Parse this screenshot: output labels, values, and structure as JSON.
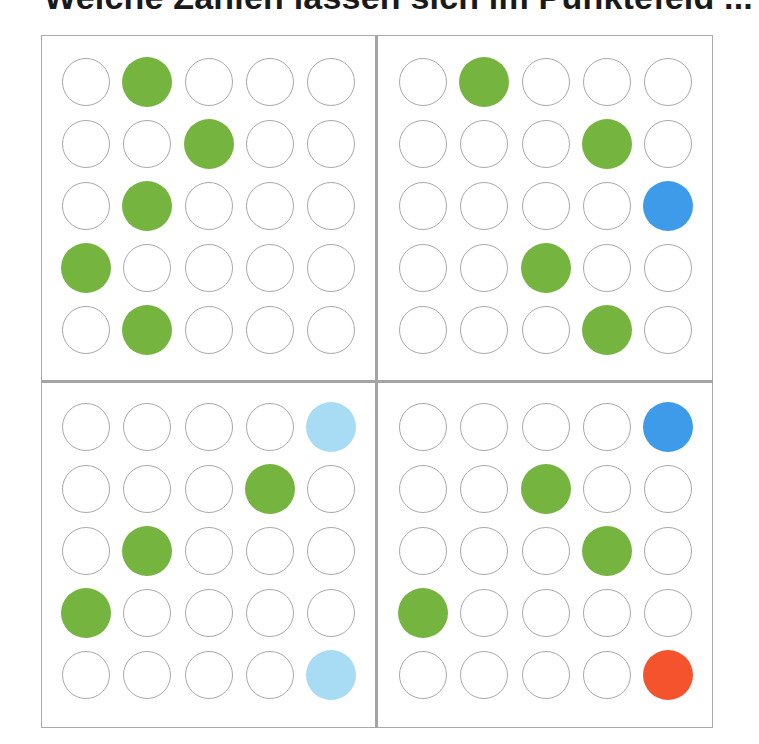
{
  "title": "Welche Zahlen lassen sich im Punktefeld ...",
  "colors": {
    "empty_outline": "#a9a9a9",
    "green": "#74b43f",
    "blue": "#3d9bea",
    "light_blue": "#a8dcf5",
    "red": "#f4532e",
    "divider": "#a4a4a4"
  },
  "grid": {
    "rows": 5,
    "cols": 5
  },
  "panels": [
    {
      "name": "top-left",
      "origin": [
        86,
        82
      ],
      "filled": [
        {
          "row": 0,
          "col": 1,
          "color": "green"
        },
        {
          "row": 1,
          "col": 2,
          "color": "green"
        },
        {
          "row": 2,
          "col": 1,
          "color": "green"
        },
        {
          "row": 3,
          "col": 0,
          "color": "green"
        },
        {
          "row": 4,
          "col": 1,
          "color": "green"
        }
      ]
    },
    {
      "name": "top-right",
      "origin": [
        423,
        82
      ],
      "filled": [
        {
          "row": 0,
          "col": 1,
          "color": "green"
        },
        {
          "row": 1,
          "col": 3,
          "color": "green"
        },
        {
          "row": 2,
          "col": 4,
          "color": "blue"
        },
        {
          "row": 3,
          "col": 2,
          "color": "green"
        },
        {
          "row": 4,
          "col": 3,
          "color": "green"
        }
      ]
    },
    {
      "name": "bottom-left",
      "origin": [
        86,
        427
      ],
      "filled": [
        {
          "row": 0,
          "col": 4,
          "color": "light_blue"
        },
        {
          "row": 1,
          "col": 3,
          "color": "green"
        },
        {
          "row": 2,
          "col": 1,
          "color": "green"
        },
        {
          "row": 3,
          "col": 0,
          "color": "green"
        },
        {
          "row": 4,
          "col": 4,
          "color": "light_blue"
        }
      ]
    },
    {
      "name": "bottom-right",
      "origin": [
        423,
        427
      ],
      "filled": [
        {
          "row": 0,
          "col": 4,
          "color": "blue"
        },
        {
          "row": 1,
          "col": 2,
          "color": "green"
        },
        {
          "row": 2,
          "col": 3,
          "color": "green"
        },
        {
          "row": 3,
          "col": 0,
          "color": "green"
        },
        {
          "row": 4,
          "col": 4,
          "color": "red"
        }
      ]
    }
  ],
  "spacing": {
    "dx": 61.3,
    "dy": 62
  }
}
